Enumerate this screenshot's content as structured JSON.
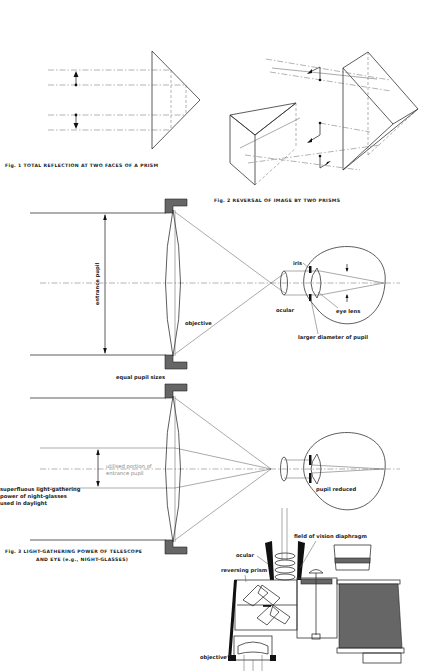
{
  "figures": {
    "fig1": {
      "caption": "Fig. 1  TOTAL REFLECTION AT TWO FACES OF A PRISM"
    },
    "fig2": {
      "caption": "Fig. 2  REVERSAL OF IMAGE BY TWO PRISMS"
    },
    "fig3": {
      "caption_line1": "Fig. 3  LIGHT-GATHERING POWER OF TELESCOPE",
      "caption_line2": "AND EYE (e.g., NIGHT-GLASSES)",
      "labels": {
        "entrance_pupil": "entrance pupil",
        "objective": "objective",
        "iris": "iris",
        "ocular": "ocular",
        "eye_lens": "eye lens",
        "larger_diameter": "larger diameter of pupil",
        "equal_pupil_sizes": "equal pupil sizes",
        "utilised_portion_line1": "utilised portion of",
        "utilised_portion_line2": "entrance pupil",
        "superfluous_line1": "superfluous light-gathering",
        "superfluous_line2": "power of night-glasses",
        "superfluous_line3": "used in daylight",
        "pupil_reduced": "pupil reduced"
      }
    },
    "fig4": {
      "labels": {
        "field_of_vision_diaphragm": "field of vision diaphragm",
        "ocular": "ocular",
        "reversing_prism": "reversing prism",
        "objective": "objective"
      }
    }
  }
}
